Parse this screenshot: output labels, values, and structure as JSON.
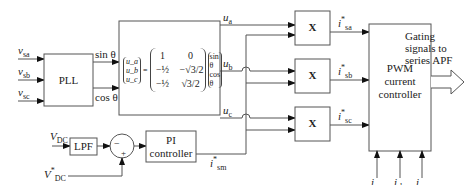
{
  "inputs": {
    "vsa": {
      "sym": "v",
      "sub": "sa"
    },
    "vsb": {
      "sym": "v",
      "sub": "sb"
    },
    "vsc": {
      "sym": "v",
      "sub": "sc"
    },
    "vdc": {
      "sym": "V",
      "sub": "DC"
    },
    "vdc_ref": {
      "sym": "V",
      "sup": "*",
      "sub": "DC"
    },
    "isa": {
      "sym": "i",
      "sub": "sa"
    },
    "isb": {
      "sym": "i",
      "sub": "sb"
    },
    "isc": {
      "sym": "i",
      "sub": "sc"
    }
  },
  "blocks": {
    "pll": "PLL",
    "lpf": "LPF",
    "pi_line1": "PI",
    "pi_line2": "controller",
    "mult": "X",
    "pwm_line1": "PWM",
    "pwm_line2": "current",
    "pwm_line3": "controller"
  },
  "signals": {
    "sin": "sin θ",
    "cos": "cos θ",
    "ua": {
      "sym": "u",
      "sub": "a"
    },
    "ub": {
      "sym": "u",
      "sub": "b"
    },
    "uc": {
      "sym": "u",
      "sub": "c"
    },
    "isa_ref": {
      "sym": "i",
      "sup": "*",
      "sub": "sa"
    },
    "isb_ref": {
      "sym": "i",
      "sup": "*",
      "sub": "sb"
    },
    "isc_ref": {
      "sym": "i",
      "sup": "*",
      "sub": "sc"
    },
    "ism_ref": {
      "sym": "i",
      "sup": "*",
      "sub": "sm"
    }
  },
  "summer": {
    "minus": "−",
    "plus": "+"
  },
  "matrix": {
    "lhs": [
      "u_a",
      "u_b",
      "u_c"
    ],
    "rows": [
      [
        "1",
        "0"
      ],
      [
        "−½",
        "−√3/2"
      ],
      [
        "−½",
        "√3/2"
      ]
    ],
    "rhs": [
      "sin θ",
      "cos θ"
    ]
  },
  "output": {
    "line1": "Gating",
    "line2": "signals to",
    "line3": "series APF"
  }
}
